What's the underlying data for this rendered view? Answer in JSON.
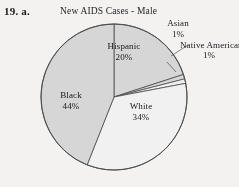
{
  "problem": {
    "label": "19.  a."
  },
  "chart_data": {
    "type": "pie",
    "title": "New AIDS Cases - Male",
    "xlabel": "",
    "ylabel": "",
    "legend_position": "none",
    "grid": false,
    "labels_inside": [
      "Hispanic",
      "Black",
      "White"
    ],
    "labels_outside": [
      "Asian",
      "Native American"
    ],
    "categories": [
      "Hispanic",
      "Asian",
      "Native American",
      "White",
      "Black"
    ],
    "values": [
      20,
      1,
      1,
      34,
      44
    ],
    "value_suffix": "%",
    "slices": [
      {
        "name": "Hispanic",
        "value": 20,
        "value_text": "20%",
        "fill": "#d6d6d6",
        "label_placement": "inside"
      },
      {
        "name": "Asian",
        "value": 1,
        "value_text": "1%",
        "fill": "#d6d6d6",
        "label_placement": "outside"
      },
      {
        "name": "Native American",
        "value": 1,
        "value_text": "1%",
        "fill": "#f0f0f0",
        "label_placement": "outside"
      },
      {
        "name": "White",
        "value": 34,
        "value_text": "34%",
        "fill": "#f2f2f2",
        "label_placement": "inside"
      },
      {
        "name": "Black",
        "value": 44,
        "value_text": "44%",
        "fill": "#d6d6d6",
        "label_placement": "inside"
      }
    ],
    "colors": {
      "paper": "#f4f3f1",
      "gray_slice": "#d6d6d6",
      "white_slice": "#f2f2f2",
      "outline": "#4a4a4a",
      "text": "#15151a"
    }
  }
}
